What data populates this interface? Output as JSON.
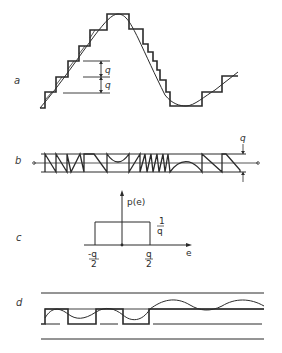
{
  "figure": {
    "type": "quantization-diagram",
    "panels": [
      {
        "id": "a",
        "label": "a",
        "description": "Sine wave with staircase quantized approximation",
        "annotations": {
          "step_label_upper": "q",
          "step_label_lower": "q"
        }
      },
      {
        "id": "b",
        "label": "b",
        "description": "Quantization error waveform confined to band of width q",
        "annotations": {
          "band_label": "q"
        }
      },
      {
        "id": "c",
        "label": "c",
        "description": "Uniform probability density of quantization error",
        "annotations": {
          "y_axis_label": "p(e)",
          "x_axis_label": "e",
          "height_label_num": "1",
          "height_label_den": "q",
          "left_tick_num": "-q",
          "left_tick_den": "2",
          "right_tick_num": "q",
          "right_tick_den": "2"
        }
      },
      {
        "id": "d",
        "label": "d",
        "description": "Small-amplitude signal with quantized square-wave output, then signal below threshold"
      }
    ]
  },
  "colors": {
    "ink": "#2b2b2b",
    "background": "#ffffff"
  }
}
